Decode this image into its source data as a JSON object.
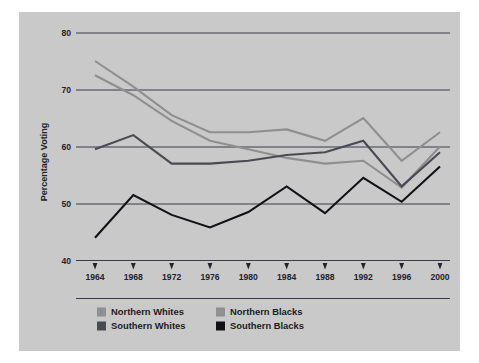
{
  "figure": {
    "background_color": "#c9c9c9",
    "axis_color": "#3b3b4a"
  },
  "chart_data": {
    "type": "line",
    "title": "",
    "xlabel": "",
    "ylabel": "Percentage Voting",
    "categories": [
      "1964",
      "1968",
      "1972",
      "1976",
      "1980",
      "1984",
      "1988",
      "1992",
      "1996",
      "2000"
    ],
    "x": [
      1964,
      1968,
      1972,
      1976,
      1980,
      1984,
      1988,
      1992,
      1996,
      2000
    ],
    "ylim": [
      40,
      80
    ],
    "yticks": [
      "40",
      "50",
      "60",
      "70",
      "80"
    ],
    "ytick_values": [
      40,
      50,
      60,
      70,
      80
    ],
    "grid": true,
    "legend_position": "below-axes",
    "series": [
      {
        "name": "Northern Whites",
        "color": "#8f8f8f",
        "values": [
          72.5,
          69.0,
          64.5,
          61.0,
          59.5,
          58.0,
          57.0,
          57.5,
          52.8,
          60.0
        ]
      },
      {
        "name": "Northern Blacks",
        "color": "#8f8f8f",
        "values": [
          75.0,
          70.5,
          65.5,
          62.5,
          62.5,
          63.0,
          61.0,
          65.0,
          57.5,
          62.5
        ]
      },
      {
        "name": "Southern Whites",
        "color": "#4a4a52",
        "values": [
          59.5,
          62.0,
          57.0,
          57.0,
          57.5,
          58.5,
          59.0,
          61.0,
          53.0,
          59.0
        ]
      },
      {
        "name": "Southern Blacks",
        "color": "#121216",
        "values": [
          44.0,
          51.5,
          48.0,
          45.8,
          48.5,
          53.0,
          48.3,
          54.5,
          50.3,
          56.5
        ]
      }
    ]
  },
  "legend": {
    "entries": [
      {
        "label": "Northern Whites",
        "color": "#8f8f8f"
      },
      {
        "label": "Northern Blacks",
        "color": "#8f8f8f"
      },
      {
        "label": "Southern Whites",
        "color": "#4a4a52"
      },
      {
        "label": "Southern Blacks",
        "color": "#121216"
      }
    ]
  }
}
